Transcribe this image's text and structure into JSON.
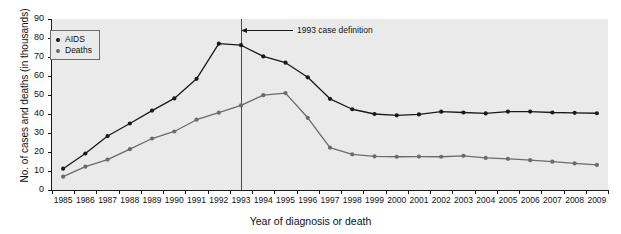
{
  "chart_data": {
    "type": "line",
    "title": "",
    "xlabel": "Year of diagnosis or death",
    "ylabel": "No. of cases and deaths (in thousands)",
    "categories": [
      "1985",
      "1986",
      "1987",
      "1988",
      "1989",
      "1990",
      "1991",
      "1992",
      "1993",
      "1994",
      "1995",
      "1996",
      "1997",
      "1998",
      "1999",
      "2000",
      "2001",
      "2002",
      "2003",
      "2004",
      "2005",
      "2006",
      "2007",
      "2008",
      "2009"
    ],
    "x": [
      1985,
      1986,
      1987,
      1988,
      1989,
      1990,
      1991,
      1992,
      1993,
      1994,
      1995,
      1996,
      1997,
      1998,
      1999,
      2000,
      2001,
      2002,
      2003,
      2004,
      2005,
      2006,
      2007,
      2008,
      2009
    ],
    "xlim": [
      1985,
      2009
    ],
    "ylim": [
      0,
      90
    ],
    "yticks": [
      0,
      10,
      20,
      30,
      40,
      50,
      60,
      70,
      80,
      90
    ],
    "grid": false,
    "legend_position": "top-left",
    "series": [
      {
        "name": "AIDS",
        "color": "#1a1a1a",
        "values": [
          11.2,
          19.2,
          28.4,
          35.0,
          41.8,
          48.2,
          58.5,
          77.0,
          76.2,
          70.3,
          67.0,
          59.3,
          48.0,
          42.5,
          40.0,
          39.3,
          39.8,
          41.2,
          40.8,
          40.3,
          41.3,
          41.3,
          40.8,
          40.6,
          40.4
        ]
      },
      {
        "name": "Deaths",
        "color": "#6b6b6b",
        "values": [
          7.0,
          12.3,
          16.0,
          21.5,
          27.1,
          30.8,
          37.0,
          40.7,
          44.5,
          49.9,
          51.0,
          38.0,
          22.3,
          18.8,
          17.7,
          17.5,
          17.6,
          17.5,
          18.0,
          16.9,
          16.4,
          15.7,
          14.9,
          14.0,
          13.2
        ]
      }
    ],
    "annotations": [
      {
        "text": "1993 case definition",
        "x": 1993,
        "type": "vertical-line-with-arrow",
        "line_color": "#4a4a4a"
      }
    ]
  },
  "legend": {
    "items": [
      {
        "label": "AIDS",
        "color": "#1a1a1a"
      },
      {
        "label": "Deaths",
        "color": "#6b6b6b"
      }
    ]
  },
  "axes": {
    "y_title": "No. of cases and deaths (in thousands)",
    "x_title": "Year of diagnosis or death",
    "y_labels": [
      "0",
      "10",
      "20",
      "30",
      "40",
      "50",
      "60",
      "70",
      "80",
      "90"
    ],
    "x_labels": [
      "1985",
      "1986",
      "1987",
      "1988",
      "1989",
      "1990",
      "1991",
      "1992",
      "1993",
      "1994",
      "1995",
      "1996",
      "1997",
      "1998",
      "1999",
      "2000",
      "2001",
      "2002",
      "2003",
      "2004",
      "2005",
      "2006",
      "2007",
      "2008",
      "2009"
    ]
  },
  "annotation": {
    "label": "1993 case definition"
  },
  "colors": {
    "plot_background": "#eaeaea",
    "page_background": "#ffffff",
    "axis": "#1a1a1a",
    "aids": "#1a1a1a",
    "deaths": "#6b6b6b",
    "reference_line": "#4a4a4a"
  }
}
